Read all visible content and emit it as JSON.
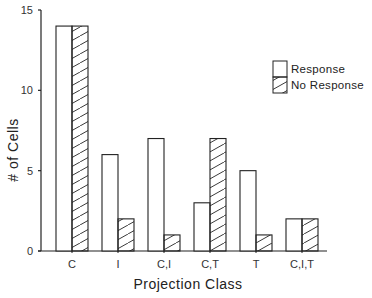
{
  "chart_data": {
    "type": "bar",
    "title": "",
    "xlabel": "Projection Class",
    "ylabel": "# of Cells",
    "categories": [
      "C",
      "I",
      "C,I",
      "C,T",
      "T",
      "C,I,T"
    ],
    "series": [
      {
        "name": "Response",
        "pattern": "open",
        "values": [
          14,
          6,
          7,
          3,
          5,
          2
        ]
      },
      {
        "name": "No Response",
        "pattern": "hatched",
        "values": [
          14,
          2,
          1,
          7,
          1,
          2
        ]
      }
    ],
    "ylim": [
      0,
      15
    ],
    "yticks": [
      0,
      5,
      10,
      15
    ],
    "grid": false,
    "legend_position": "upper right"
  },
  "axes": {
    "xlabel": "Projection Class",
    "ylabel": "# of Cells",
    "yticks": [
      "0",
      "5",
      "10",
      "15"
    ],
    "xticks": [
      "C",
      "I",
      "C,I",
      "C,T",
      "T",
      "C,I,T"
    ]
  },
  "legend": {
    "items": [
      {
        "label": "Response"
      },
      {
        "label": "No Response"
      }
    ]
  }
}
